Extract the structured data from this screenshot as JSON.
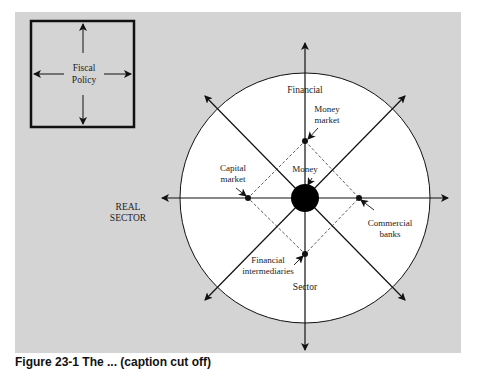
{
  "figure": {
    "fiscal_box": {
      "line1": "Fiscal",
      "line2": "Policy"
    },
    "real_sector": {
      "line1": "REAL",
      "line2": "SECTOR"
    },
    "financial_sector": {
      "top": "Financial",
      "bottom": "Sector"
    },
    "center": {
      "label": "Money"
    },
    "nodes": {
      "money_market": {
        "line1": "Money",
        "line2": "market"
      },
      "capital_market": {
        "line1": "Capital",
        "line2": "market"
      },
      "commercial_banks": {
        "line1": "Commercial",
        "line2": "banks"
      },
      "financial_intermediaries": {
        "line1": "Financial",
        "line2": "intermediaries"
      }
    },
    "caption_partial": "Figure 23-1  The ... (caption cut off)"
  },
  "colors": {
    "panel": "#d4d4d4",
    "circle_fill": "#ffffff",
    "ink": "#111111"
  }
}
